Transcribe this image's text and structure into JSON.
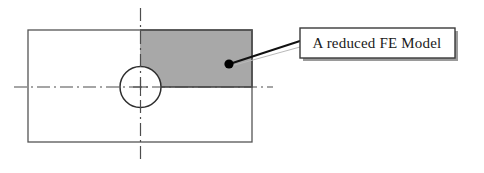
{
  "figure": {
    "background_color": "#ffffff",
    "line_color": "#333333",
    "shade_color": "#a8a8a8",
    "centerline_color": "#4d4d4d",
    "callout": {
      "label": "A reduced FE Model",
      "box": {
        "x": 300,
        "y": 28,
        "width": 155,
        "height": 30,
        "fill": "#ffffff",
        "stroke": "#3a3a3a",
        "shadow_color": "#9a9a9a"
      },
      "text_x": 377,
      "text_y": 48,
      "leader": {
        "from_x": 300,
        "from_y": 43,
        "to_x": 231,
        "to_y": 64,
        "stroke": "#1a1a1a"
      },
      "marker": {
        "cx": 229,
        "cy": 64,
        "r": 4.6,
        "fill": "#000000"
      }
    },
    "plate": {
      "x": 28,
      "y": 30,
      "width": 224,
      "height": 112,
      "stroke": "#555555",
      "fill": "none"
    },
    "reduced_region": {
      "x": 140,
      "y": 30,
      "width": 112,
      "height": 57,
      "fill": "#a8a8a8",
      "stroke": "#3b3b3b",
      "quadrant": "upper-right"
    },
    "hole": {
      "cx": 140.5,
      "cy": 87,
      "r": 20.5,
      "stroke": "#2e2e2e",
      "fill": "#ffffff"
    },
    "vertical_centerline": {
      "x": 140.5,
      "y1": 8,
      "y2": 163
    },
    "horizontal_centerline": {
      "y": 87,
      "x1": 14,
      "x2": 273
    }
  }
}
